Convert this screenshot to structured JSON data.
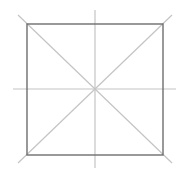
{
  "diagram": {
    "type": "square-with-symmetry-lines",
    "canvas": {
      "width": 181,
      "height": 173
    },
    "colors": {
      "background": "#ffffff",
      "square_stroke": "#6e6e6e",
      "guide_stroke": "#c4c4c4"
    },
    "square": {
      "x1": 27,
      "y1": 24,
      "x2": 163,
      "y2": 155
    },
    "center": {
      "x": 95,
      "y": 89
    },
    "lines": [
      {
        "name": "vertical-axis",
        "x1": 95,
        "y1": 10,
        "x2": 95,
        "y2": 168
      },
      {
        "name": "horizontal-axis",
        "x1": 13,
        "y1": 89,
        "x2": 176,
        "y2": 89
      },
      {
        "name": "diagonal-main",
        "x1": 18,
        "y1": 15,
        "x2": 172,
        "y2": 163
      },
      {
        "name": "diagonal-anti",
        "x1": 172,
        "y1": 15,
        "x2": 18,
        "y2": 163
      }
    ]
  }
}
